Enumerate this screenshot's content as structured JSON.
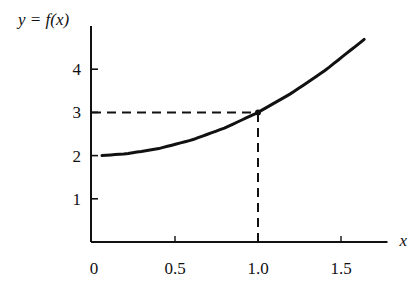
{
  "chart_data": {
    "type": "line",
    "title": "",
    "ylabel": "y = f(x)",
    "xlabel": "x",
    "xlim": [
      0,
      1.75
    ],
    "ylim": [
      0,
      5
    ],
    "x_ticks": [
      "0",
      "0.5",
      "1.0",
      "1.5"
    ],
    "y_ticks": [
      "1",
      "2",
      "3",
      "4"
    ],
    "grid": false,
    "legend": null,
    "series": [
      {
        "name": "f(x)",
        "style": "solid",
        "x": [
          0.06,
          0.2,
          0.4,
          0.6,
          0.8,
          1.0,
          1.2,
          1.4,
          1.64
        ],
        "values": [
          2.0,
          2.04,
          2.16,
          2.36,
          2.64,
          3.0,
          3.44,
          3.96,
          4.69
        ]
      }
    ],
    "annotations": [
      {
        "type": "dashed-horizontal",
        "from": [
          0,
          3
        ],
        "to": [
          1.0,
          3
        ],
        "label": "f(1.0) = 3"
      },
      {
        "type": "dashed-vertical",
        "from": [
          1.0,
          0
        ],
        "to": [
          1.0,
          3
        ],
        "label": "x = 1.0"
      },
      {
        "type": "point",
        "at": [
          1.0,
          3
        ]
      }
    ]
  },
  "labels": {
    "y_axis": "y = f(x)",
    "x_axis": "x",
    "origin": "0"
  }
}
